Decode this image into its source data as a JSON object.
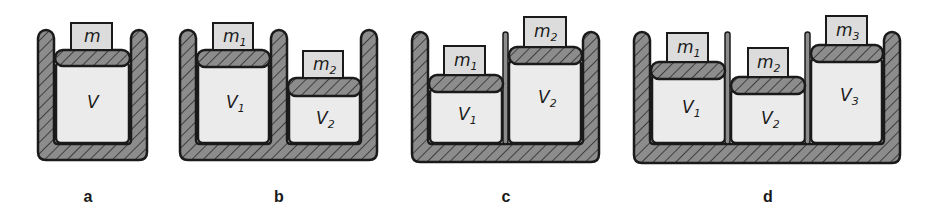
{
  "diagram": {
    "panels": [
      {
        "caption": "a",
        "cylinders": [
          {
            "volume_label": "V",
            "volume_sub": "",
            "mass_label": "m",
            "mass_sub": ""
          }
        ]
      },
      {
        "caption": "b",
        "cylinders": [
          {
            "volume_label": "V",
            "volume_sub": "1",
            "mass_label": "m",
            "mass_sub": "1"
          },
          {
            "volume_label": "V",
            "volume_sub": "2",
            "mass_label": "m",
            "mass_sub": "2"
          }
        ]
      },
      {
        "caption": "c",
        "cylinders": [
          {
            "volume_label": "V",
            "volume_sub": "1",
            "mass_label": "m",
            "mass_sub": "1"
          },
          {
            "volume_label": "V",
            "volume_sub": "2",
            "mass_label": "m",
            "mass_sub": "2"
          }
        ]
      },
      {
        "caption": "d",
        "cylinders": [
          {
            "volume_label": "V",
            "volume_sub": "1",
            "mass_label": "m",
            "mass_sub": "1"
          },
          {
            "volume_label": "V",
            "volume_sub": "2",
            "mass_label": "m",
            "mass_sub": "2"
          },
          {
            "volume_label": "V",
            "volume_sub": "3",
            "mass_label": "m",
            "mass_sub": "3"
          }
        ]
      }
    ],
    "colors": {
      "outline": "#1a1a1a",
      "hatch_fill": "#8c8c8c",
      "gas_fill": "#ebebeb",
      "mass_fill": "#dcdcdc"
    }
  }
}
